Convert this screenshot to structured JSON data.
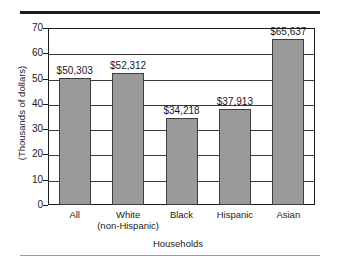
{
  "chart_data": {
    "type": "bar",
    "title": "",
    "xlabel": "Households",
    "ylabel": "(Thousands of dollars)",
    "categories": [
      "All",
      "White\n(non-Hispanic)",
      "Black",
      "Hispanic",
      "Asian"
    ],
    "category_lines": [
      [
        "All"
      ],
      [
        "White",
        "(non-Hispanic)"
      ],
      [
        "Black"
      ],
      [
        "Hispanic"
      ],
      [
        "Asian"
      ]
    ],
    "values": [
      50.303,
      52.312,
      34.218,
      37.913,
      65.637
    ],
    "value_labels": [
      "$50,303",
      "$52,312",
      "$34,218",
      "$37,913",
      "$65,637"
    ],
    "ylim": [
      0,
      70
    ],
    "ytick_values": [
      0,
      10,
      20,
      30,
      40,
      50,
      60,
      70
    ],
    "ytick_labels": [
      "0",
      "10",
      "20",
      "30",
      "40",
      "50",
      "60",
      "70"
    ],
    "grid": true,
    "legend": false,
    "bar_color": "#9a9a9a",
    "bar_border_color": "#3d3d3d",
    "axis_color": "#1c1c1c",
    "background_color": "#ffffff"
  }
}
